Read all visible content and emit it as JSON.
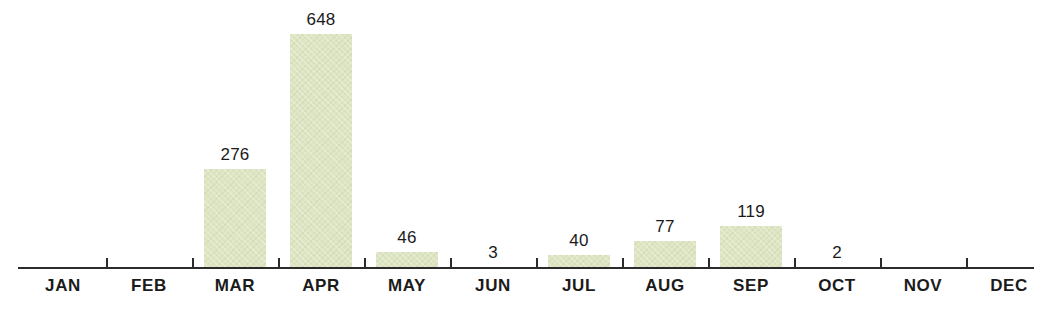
{
  "chart_data": {
    "type": "bar",
    "title": "",
    "subtitle": "",
    "xlabel": "",
    "ylabel": "",
    "categories": [
      "JAN",
      "FEB",
      "MAR",
      "APR",
      "MAY",
      "JUN",
      "JUL",
      "AUG",
      "SEP",
      "OCT",
      "NOV",
      "DEC"
    ],
    "values": [
      0,
      0,
      276,
      648,
      46,
      3,
      40,
      77,
      119,
      2,
      0,
      0
    ],
    "value_labels": [
      "",
      "",
      "276",
      "648",
      "46",
      "3",
      "40",
      "77",
      "119",
      "2",
      "",
      ""
    ],
    "ylim": [
      0,
      648
    ],
    "grid": false,
    "legend": null,
    "bar_color": "#dde5c3",
    "axis_color": "#2b2b2b",
    "label_color": "#1b1b1b",
    "background": "#ffffff",
    "series": [
      {
        "name": "",
        "values": [
          0,
          0,
          276,
          648,
          46,
          3,
          40,
          77,
          119,
          2,
          0,
          0
        ]
      }
    ]
  },
  "axis": {
    "tick_count": 12
  }
}
